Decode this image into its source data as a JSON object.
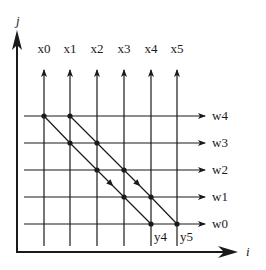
{
  "axes": {
    "vertical_label": "j",
    "horizontal_label": "i"
  },
  "columns": [
    {
      "label": "x0",
      "x": 44
    },
    {
      "label": "x1",
      "x": 70
    },
    {
      "label": "x2",
      "x": 97
    },
    {
      "label": "x3",
      "x": 124
    },
    {
      "label": "x4",
      "x": 151
    },
    {
      "label": "x5",
      "x": 177
    }
  ],
  "rows": [
    {
      "label": "w4",
      "y": 116
    },
    {
      "label": "w3",
      "y": 143
    },
    {
      "label": "w2",
      "y": 170
    },
    {
      "label": "w1",
      "y": 197
    },
    {
      "label": "w0",
      "y": 224
    }
  ],
  "bottom_labels": [
    {
      "label": "y4",
      "x": 155,
      "y": 239
    },
    {
      "label": "y5",
      "x": 180,
      "y": 239
    }
  ],
  "diagonals": [
    {
      "name": "diagonal-a",
      "points": [
        [
          44,
          116
        ],
        [
          70,
          143
        ],
        [
          97,
          170
        ],
        [
          124,
          197
        ],
        [
          151,
          224
        ]
      ]
    },
    {
      "name": "diagonal-b",
      "points": [
        [
          70,
          116
        ],
        [
          97,
          143
        ],
        [
          124,
          170
        ],
        [
          151,
          197
        ],
        [
          177,
          224
        ]
      ]
    }
  ],
  "colors": {
    "ink": "#1a1a1a",
    "background": "#ffffff"
  }
}
